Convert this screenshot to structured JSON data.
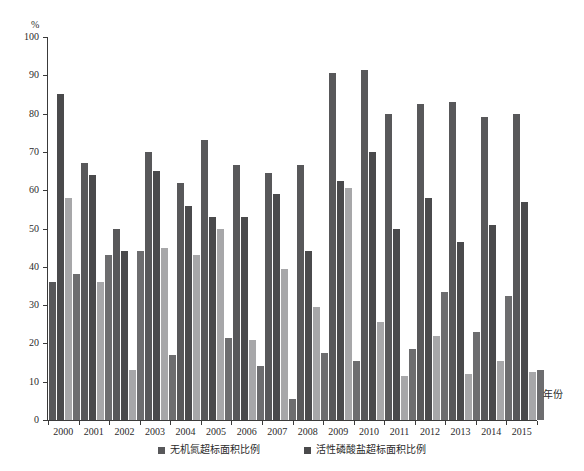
{
  "chart_data": {
    "type": "bar",
    "title": "",
    "subtitle": "",
    "xlabel": "年份",
    "ylabel": "%",
    "ylim": [
      0,
      100
    ],
    "yticks": [
      0,
      10,
      20,
      30,
      40,
      50,
      60,
      70,
      80,
      90,
      100
    ],
    "grid": false,
    "legend_position": "bottom",
    "categories": [
      "2000",
      "2001",
      "2002",
      "2003",
      "2004",
      "2005",
      "2006",
      "2007",
      "2008",
      "2009",
      "2010",
      "2011",
      "2012",
      "2013",
      "2014",
      "2015"
    ],
    "series": [
      {
        "name": "无机氮超标面积比例",
        "color": "#58585a",
        "values": [
          36,
          67,
          50,
          70,
          62,
          73,
          66.5,
          64.5,
          66.5,
          90.5,
          91.5,
          80,
          82.5,
          83,
          79,
          80
        ]
      },
      {
        "name": "活性磷酸盐超标面积比例",
        "color": "#4a4a4c",
        "values": [
          85,
          64,
          44,
          65,
          56,
          53,
          53,
          59,
          44,
          62.5,
          70,
          50,
          58,
          46.5,
          51,
          57
        ]
      },
      {
        "name": "其他超标面积比例",
        "color": "#a7a7a9",
        "values": [
          58,
          36,
          13,
          45,
          43,
          50,
          21,
          39.5,
          29.5,
          60.5,
          25.5,
          11.5,
          22,
          12,
          15.5,
          12.5
        ]
      },
      {
        "name": "第四项超标面积比例",
        "color": "#6d6d6f",
        "values": [
          38,
          43,
          44,
          17,
          0,
          21.5,
          14,
          5.5,
          17.5,
          15.5,
          0,
          18.5,
          33.5,
          23,
          32.5,
          13
        ]
      }
    ]
  },
  "axes": {
    "y_unit_label": "%",
    "y_tick_labels": [
      "100",
      "90",
      "80",
      "70",
      "60",
      "50",
      "40",
      "30",
      "20",
      "10",
      "0"
    ],
    "x_axis_title": "年份",
    "x_tick_labels": [
      "2000",
      "2001",
      "2002",
      "2003",
      "2004",
      "2005",
      "2006",
      "2007",
      "2008",
      "2009",
      "2010",
      "2011",
      "2012",
      "2013",
      "2014",
      "2015"
    ]
  },
  "legend": {
    "items": [
      {
        "label": "无机氮超标面积比例",
        "color": "#58585a"
      },
      {
        "label": "活性磷酸盐超标面积比例",
        "color": "#4a4a4c"
      }
    ]
  }
}
